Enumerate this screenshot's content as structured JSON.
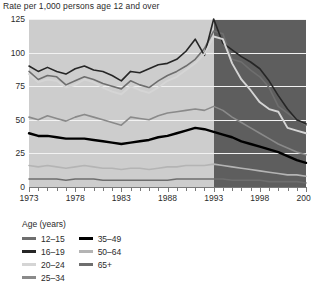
{
  "chart_data": {
    "type": "line",
    "title": "Rate per 1,000 persons age 12 and over",
    "xlabel": "",
    "ylabel": "",
    "ylim": [
      0,
      125
    ],
    "xlim": [
      1973,
      2003
    ],
    "yticks": [
      125,
      100,
      75,
      50,
      25,
      0
    ],
    "xticks": [
      1973,
      1978,
      1983,
      1988,
      1993,
      1998,
      2003
    ],
    "grid": true,
    "legend_position": "below",
    "legend_title": "Age (years)",
    "shaded_region": {
      "from": 1993,
      "to": 2003,
      "color": "#5e5e5e"
    },
    "plot_background": "#cdcdcd",
    "x": [
      1973,
      1974,
      1975,
      1976,
      1977,
      1978,
      1979,
      1980,
      1981,
      1982,
      1983,
      1984,
      1985,
      1986,
      1987,
      1988,
      1989,
      1990,
      1991,
      1992,
      1993,
      1994,
      1995,
      1996,
      1997,
      1998,
      1999,
      2000,
      2001,
      2002,
      2003
    ],
    "series": [
      {
        "name": "12-15",
        "color": "#6e6e6e",
        "width": 1.6,
        "values": [
          86,
          80,
          83,
          82,
          76,
          79,
          82,
          80,
          77,
          75,
          73,
          79,
          76,
          74,
          79,
          83,
          86,
          90,
          95,
          103,
          116,
          114,
          95,
          93,
          87,
          82,
          74,
          60,
          55,
          50,
          46
        ]
      },
      {
        "name": "16-19",
        "color": "#262626",
        "width": 1.6,
        "values": [
          90,
          86,
          89,
          86,
          84,
          88,
          90,
          87,
          86,
          83,
          79,
          86,
          85,
          88,
          91,
          92,
          95,
          101,
          110,
          98,
          125,
          107,
          102,
          97,
          93,
          88,
          79,
          68,
          58,
          50,
          47
        ]
      },
      {
        "name": "20-24",
        "color": "#d5d5d5",
        "width": 1.9,
        "values": [
          84,
          78,
          80,
          79,
          74,
          76,
          80,
          78,
          74,
          71,
          69,
          75,
          72,
          70,
          74,
          79,
          82,
          87,
          92,
          99,
          112,
          110,
          92,
          80,
          72,
          63,
          58,
          56,
          44,
          42,
          40
        ]
      },
      {
        "name": "25-34",
        "color": "#8a8a8a",
        "width": 1.6,
        "values": [
          52,
          50,
          53,
          51,
          49,
          52,
          54,
          52,
          50,
          48,
          46,
          52,
          51,
          50,
          53,
          55,
          56,
          57,
          58,
          57,
          60,
          57,
          52,
          48,
          44,
          40,
          36,
          32,
          29,
          26,
          24
        ]
      },
      {
        "name": "35-49",
        "color": "#000000",
        "width": 2.4,
        "values": [
          40,
          38,
          38,
          37,
          36,
          36,
          36,
          35,
          34,
          33,
          32,
          33,
          34,
          35,
          37,
          38,
          40,
          42,
          44,
          43,
          41,
          39,
          37,
          34,
          32,
          30,
          28,
          26,
          23,
          20,
          18
        ]
      },
      {
        "name": "50-64",
        "color": "#b4b4b4",
        "width": 1.6,
        "values": [
          16,
          15,
          16,
          15,
          14,
          15,
          16,
          15,
          14,
          14,
          13,
          14,
          14,
          13,
          14,
          15,
          15,
          16,
          16,
          16,
          17,
          16,
          15,
          14,
          13,
          12,
          11,
          10,
          9,
          9,
          8
        ]
      },
      {
        "name": "65+",
        "color": "#6e6e6e",
        "width": 1.6,
        "values": [
          6,
          6,
          6,
          6,
          5,
          6,
          6,
          6,
          5,
          5,
          5,
          5,
          5,
          5,
          5,
          5,
          6,
          6,
          6,
          6,
          6,
          6,
          5,
          5,
          5,
          5,
          4,
          4,
          4,
          4,
          3
        ]
      }
    ]
  },
  "legend": {
    "title": "Age (years)",
    "columns": [
      [
        {
          "label": "12–15",
          "color": "#6e6e6e"
        },
        {
          "label": "16–19",
          "color": "#262626"
        },
        {
          "label": "20–24",
          "color": "#d5d5d5"
        },
        {
          "label": "25–34",
          "color": "#8a8a8a"
        }
      ],
      [
        {
          "label": "35–49",
          "color": "#000000"
        },
        {
          "label": "50–64",
          "color": "#b4b4b4"
        },
        {
          "label": "65+",
          "color": "#6e6e6e"
        }
      ]
    ]
  }
}
